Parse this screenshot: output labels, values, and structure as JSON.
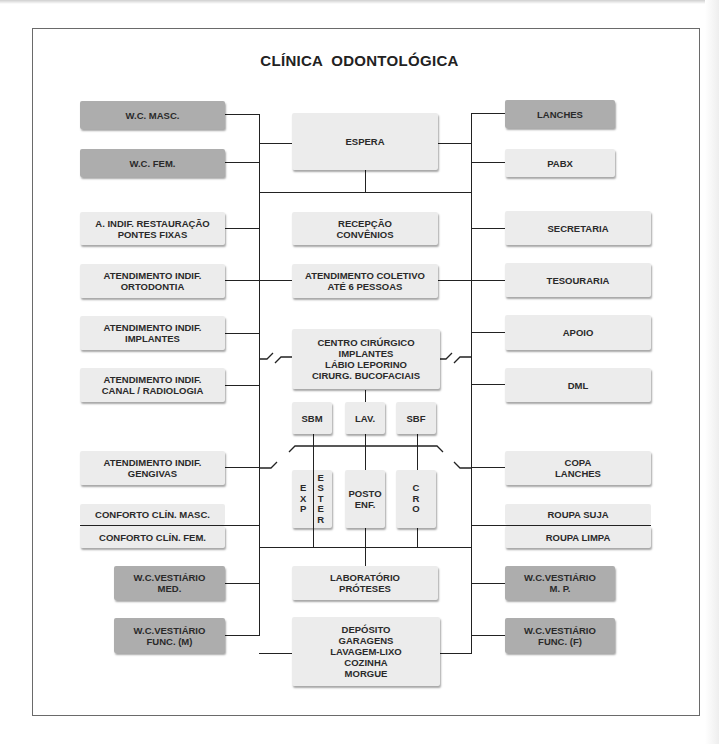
{
  "title": "CLÍNICA  ODONTOLÓGICA",
  "colors": {
    "light_box": "#ececec",
    "dark_box": "#adadad",
    "line": "#222222",
    "frame": "#6a6a6a"
  },
  "left_column": [
    {
      "label": "W.C. MASC.",
      "style": "dark"
    },
    {
      "label": "W.C. FEM.",
      "style": "dark"
    },
    {
      "label": "A. INDIF. RESTAURAÇÃO\nPONTES FIXAS",
      "style": "light"
    },
    {
      "label": "ATENDIMENTO INDIF.\nORTODONTIA",
      "style": "light"
    },
    {
      "label": "ATENDIMENTO INDIF.\nIMPLANTES",
      "style": "light"
    },
    {
      "label": "ATENDIMENTO INDIF.\nCANAL / RADIOLOGIA",
      "style": "light"
    },
    {
      "label": "ATENDIMENTO INDIF.\nGENGIVAS",
      "style": "light"
    },
    {
      "label": "CONFORTO CLÍN. MASC.",
      "style": "light"
    },
    {
      "label": "CONFORTO CLÍN. FEM.",
      "style": "light"
    },
    {
      "label": "W.C.VESTIÁRIO\nMED.",
      "style": "dark"
    },
    {
      "label": "W.C.VESTIÁRIO\nFUNC. (M)",
      "style": "dark"
    }
  ],
  "center_column": [
    {
      "label": "ESPERA",
      "style": "light"
    },
    {
      "label": "RECEPÇÃO\nCONVÊNIOS",
      "style": "light"
    },
    {
      "label": "ATENDIMENTO COLETIVO\nATÉ 6 PESSOAS",
      "style": "light"
    },
    {
      "label": "CENTRO CIRÚRGICO\nIMPLANTES\nLÁBIO LEPORINO\nCIRURG. BUCOFACIAIS",
      "style": "light"
    },
    {
      "label": "SBM",
      "style": "light"
    },
    {
      "label": "LAV.",
      "style": "light"
    },
    {
      "label": "SBF",
      "style": "light"
    },
    {
      "label": "EXP",
      "style": "light",
      "vertical": true,
      "letters": [
        "E",
        "X",
        "P"
      ]
    },
    {
      "label": "ESTER",
      "style": "light",
      "vertical": true,
      "letters": [
        "E",
        "S",
        "T",
        "E",
        "R"
      ]
    },
    {
      "label": "POSTO\nENF.",
      "style": "light"
    },
    {
      "label": "CRO",
      "style": "light",
      "vertical": true,
      "letters": [
        "C",
        "R",
        "O"
      ]
    },
    {
      "label": "LABORATÓRIO\nPRÓTESES",
      "style": "light"
    },
    {
      "label": "DEPÓSITO\nGARAGENS\nLAVAGEM-LIXO\nCOZINHA\nMORGUE",
      "style": "light"
    }
  ],
  "right_column": [
    {
      "label": "LANCHES",
      "style": "dark"
    },
    {
      "label": "PABX",
      "style": "light"
    },
    {
      "label": "SECRETARIA",
      "style": "light"
    },
    {
      "label": "TESOURARIA",
      "style": "light"
    },
    {
      "label": "APOIO",
      "style": "light"
    },
    {
      "label": "DML",
      "style": "light"
    },
    {
      "label": "COPA\nLANCHES",
      "style": "light"
    },
    {
      "label": "ROUPA SUJA",
      "style": "light"
    },
    {
      "label": "ROUPA LIMPA",
      "style": "light"
    },
    {
      "label": "W.C.VESTIÁRIO\nM. P.",
      "style": "dark"
    },
    {
      "label": "W.C.VESTIÁRIO\nFUNC. (F)",
      "style": "dark"
    }
  ]
}
